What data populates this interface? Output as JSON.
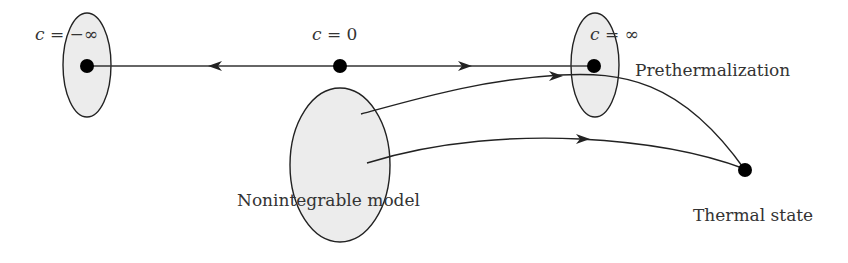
{
  "diagram": {
    "type": "flow-diagram",
    "colors": {
      "stroke": "#222222",
      "ellipse_fill": "#ececec",
      "node": "#000000",
      "text": "#333333"
    },
    "nodes": [
      {
        "id": "c_neg_inf",
        "label": "c = −∞",
        "x": 87,
        "y": 66
      },
      {
        "id": "c_zero",
        "label": "c = 0",
        "x": 340,
        "y": 66
      },
      {
        "id": "c_inf",
        "label": "c = ∞",
        "x": 594,
        "y": 66
      },
      {
        "id": "thermal",
        "label": "Thermal state",
        "x": 745,
        "y": 170
      }
    ],
    "regions": [
      {
        "id": "left-region",
        "cx": 87,
        "cy": 65,
        "rx": 24,
        "ry": 52
      },
      {
        "id": "prethermal-region",
        "label": "Prethermalization",
        "cx": 595,
        "cy": 65,
        "rx": 24,
        "ry": 52
      },
      {
        "id": "nonintegrable-region",
        "label": "Nonintegrable model",
        "cx": 340,
        "cy": 165,
        "rx": 50,
        "ry": 77
      }
    ],
    "edges": [
      {
        "from": "c_zero",
        "to": "c_neg_inf",
        "style": "arrow-mid"
      },
      {
        "from": "c_zero",
        "to": "c_inf",
        "style": "arrow-mid"
      },
      {
        "from": "nonintegrable-region",
        "to": "prethermal-region",
        "style": "curved-arrow-then-to-thermal"
      },
      {
        "from": "nonintegrable-region",
        "to": "thermal",
        "style": "curved-arrow"
      }
    ]
  },
  "labels": {
    "c_neg_inf_c": "c",
    "c_neg_inf_eq": " = −∞",
    "c_zero_c": "c",
    "c_zero_eq": " = 0",
    "c_inf_c": "c",
    "c_inf_eq": " = ∞",
    "prethermalization": "Prethermalization",
    "nonintegrable": "Nonintegrable model",
    "thermal_state": "Thermal state"
  }
}
